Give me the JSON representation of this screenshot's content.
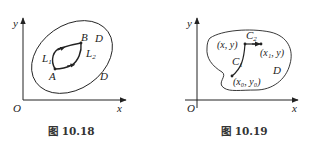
{
  "figures": [
    {
      "id": "fig-10-18",
      "caption": "图 10.18",
      "axes": {
        "x_label": "x",
        "y_label": "y",
        "origin_label": "O"
      },
      "region_label": "D",
      "region_label_2": "D",
      "points": {
        "A": "A",
        "B": "B"
      },
      "curves": {
        "L1": "L",
        "L1_sub": "1",
        "L2": "L",
        "L2_sub": "2"
      }
    },
    {
      "id": "fig-10-19",
      "caption": "图 10.19",
      "axes": {
        "x_label": "x",
        "y_label": "y",
        "origin_label": "O"
      },
      "region_label": "D",
      "points": {
        "start": "(x₀, y₀)",
        "mid": "(x, y)",
        "end": "(x₁, y)"
      },
      "curves": {
        "C1": "C",
        "C1_sub": "1",
        "C2": "C",
        "C2_sub": "2"
      }
    }
  ],
  "colors": {
    "ink": "#222222",
    "background": "#ffffff"
  }
}
